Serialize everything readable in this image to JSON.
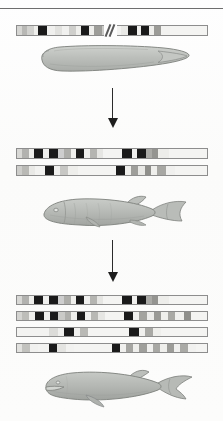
{
  "figure": {
    "background_color": "#fdfdfd",
    "rule_color": "#6e6e6e",
    "arrow_color": "#1d1d1d",
    "band_dark_color": "#1a1a1a",
    "band_light_color": "#f0f0ee",
    "organism_fill_color": "#b9bcb8",
    "organism_outline_color": "#7d807c"
  },
  "stages": [
    {
      "id": "stage-1",
      "label": "lancelet-stage",
      "organism_name": "lancelet",
      "chromosome_count": 1,
      "has_break_symbol": true,
      "break_symbol_name": "chromosome-break-slashes",
      "chromosomes": [
        {
          "id": "chromosome-1-1",
          "bands": [
            {
              "w": 5,
              "c": "#d6d6d3"
            },
            {
              "w": 5,
              "c": "#b8b8b5"
            },
            {
              "w": 6,
              "c": "#d2d2cf"
            },
            {
              "w": 4,
              "c": "#efefec"
            },
            {
              "w": 9,
              "c": "#1a1a1a"
            },
            {
              "w": 8,
              "c": "#f0f0ee"
            },
            {
              "w": 7,
              "c": "#e2e2df"
            },
            {
              "w": 6,
              "c": "#f1f1ef"
            },
            {
              "w": 7,
              "c": "#cfcfcc"
            },
            {
              "w": 5,
              "c": "#efefec"
            },
            {
              "w": 8,
              "c": "#1a1a1a"
            },
            {
              "w": 5,
              "c": "#eeeeeb"
            },
            {
              "w": 7,
              "c": "#9d9d99"
            },
            {
              "w": 6,
              "c": "#c9c9c6"
            },
            {
              "w": 13,
              "c": "#f3f3f1"
            },
            {
              "w": 7,
              "c": "#e9e9e6"
            },
            {
              "w": 8,
              "c": "#1a1a1a"
            },
            {
              "w": 4,
              "c": "#f0f0ee"
            },
            {
              "w": 8,
              "c": "#1a1a1a"
            },
            {
              "w": 5,
              "c": "#eeeeeb"
            },
            {
              "w": 7,
              "c": "#9b9b97"
            },
            {
              "w": 8,
              "c": "#f2f2f0"
            },
            {
              "w": 38,
              "c": "#f4f4f2"
            }
          ]
        }
      ]
    },
    {
      "id": "stage-2",
      "label": "fish-stage",
      "organism_name": "fish",
      "chromosome_count": 2,
      "has_break_symbol": false,
      "chromosomes": [
        {
          "id": "chromosome-2-1",
          "bands": [
            {
              "w": 5,
              "c": "#d8d8d5"
            },
            {
              "w": 6,
              "c": "#b2b2af"
            },
            {
              "w": 5,
              "c": "#eeeeeb"
            },
            {
              "w": 9,
              "c": "#1a1a1a"
            },
            {
              "w": 5,
              "c": "#f0f0ee"
            },
            {
              "w": 9,
              "c": "#1a1a1a"
            },
            {
              "w": 6,
              "c": "#cecece"
            },
            {
              "w": 6,
              "c": "#aeaeaa"
            },
            {
              "w": 5,
              "c": "#efefec"
            },
            {
              "w": 8,
              "c": "#1a1a1a"
            },
            {
              "w": 5,
              "c": "#f0f0ee"
            },
            {
              "w": 7,
              "c": "#b5b5b1"
            },
            {
              "w": 6,
              "c": "#e6e6e3"
            },
            {
              "w": 18,
              "c": "#f4f4f2"
            },
            {
              "w": 9,
              "c": "#1a1a1a"
            },
            {
              "w": 5,
              "c": "#f0f0ee"
            },
            {
              "w": 8,
              "c": "#1a1a1a"
            },
            {
              "w": 6,
              "c": "#aaaaa6"
            },
            {
              "w": 6,
              "c": "#949490"
            },
            {
              "w": 10,
              "c": "#ededea"
            },
            {
              "w": 38,
              "c": "#f4f4f2"
            }
          ]
        },
        {
          "id": "chromosome-2-2",
          "bands": [
            {
              "w": 5,
              "c": "#cdcdca"
            },
            {
              "w": 6,
              "c": "#b9b9b5"
            },
            {
              "w": 6,
              "c": "#e9e9e6"
            },
            {
              "w": 10,
              "c": "#f2f2f0"
            },
            {
              "w": 8,
              "c": "#1a1a1a"
            },
            {
              "w": 6,
              "c": "#f0f0ee"
            },
            {
              "w": 7,
              "c": "#c7c7c4"
            },
            {
              "w": 10,
              "c": "#eeeeeb"
            },
            {
              "w": 36,
              "c": "#f4f4f2"
            },
            {
              "w": 8,
              "c": "#1a1a1a"
            },
            {
              "w": 6,
              "c": "#efefec"
            },
            {
              "w": 7,
              "c": "#9e9e9a"
            },
            {
              "w": 6,
              "c": "#e8e8e5"
            },
            {
              "w": 6,
              "c": "#8f8f8b"
            },
            {
              "w": 6,
              "c": "#efefec"
            },
            {
              "w": 8,
              "c": "#a7a7a3"
            },
            {
              "w": 9,
              "c": "#f0f0ee"
            },
            {
              "w": 32,
              "c": "#f4f4f2"
            }
          ]
        }
      ]
    },
    {
      "id": "stage-3",
      "label": "whale-stage",
      "organism_name": "whale",
      "chromosome_count": 4,
      "has_break_symbol": false,
      "chromosomes": [
        {
          "id": "chromosome-3-1",
          "bands": [
            {
              "w": 5,
              "c": "#d8d8d5"
            },
            {
              "w": 6,
              "c": "#b2b2af"
            },
            {
              "w": 5,
              "c": "#eeeeeb"
            },
            {
              "w": 9,
              "c": "#1a1a1a"
            },
            {
              "w": 5,
              "c": "#f0f0ee"
            },
            {
              "w": 9,
              "c": "#1a1a1a"
            },
            {
              "w": 6,
              "c": "#cecece"
            },
            {
              "w": 6,
              "c": "#aeaeaa"
            },
            {
              "w": 5,
              "c": "#efefec"
            },
            {
              "w": 8,
              "c": "#1a1a1a"
            },
            {
              "w": 5,
              "c": "#f0f0ee"
            },
            {
              "w": 7,
              "c": "#b5b5b1"
            },
            {
              "w": 6,
              "c": "#e6e6e3"
            },
            {
              "w": 18,
              "c": "#f4f4f2"
            },
            {
              "w": 9,
              "c": "#1a1a1a"
            },
            {
              "w": 5,
              "c": "#f0f0ee"
            },
            {
              "w": 8,
              "c": "#1a1a1a"
            },
            {
              "w": 6,
              "c": "#aaaaa6"
            },
            {
              "w": 6,
              "c": "#949490"
            },
            {
              "w": 10,
              "c": "#ededea"
            },
            {
              "w": 38,
              "c": "#f4f4f2"
            }
          ]
        },
        {
          "id": "chromosome-3-2",
          "bands": [
            {
              "w": 5,
              "c": "#d4d4d1"
            },
            {
              "w": 6,
              "c": "#bdbdb9"
            },
            {
              "w": 6,
              "c": "#eeeeeb"
            },
            {
              "w": 8,
              "c": "#1a1a1a"
            },
            {
              "w": 5,
              "c": "#f0f0ee"
            },
            {
              "w": 8,
              "c": "#1a1a1a"
            },
            {
              "w": 6,
              "c": "#cacac7"
            },
            {
              "w": 6,
              "c": "#b0b0ac"
            },
            {
              "w": 5,
              "c": "#efefec"
            },
            {
              "w": 8,
              "c": "#1a1a1a"
            },
            {
              "w": 5,
              "c": "#f0f0ee"
            },
            {
              "w": 7,
              "c": "#b8b8b4"
            },
            {
              "w": 6,
              "c": "#e6e6e3"
            },
            {
              "w": 18,
              "c": "#f4f4f2"
            },
            {
              "w": 8,
              "c": "#1a1a1a"
            },
            {
              "w": 6,
              "c": "#f0f0ee"
            },
            {
              "w": 7,
              "c": "#a3a39f"
            },
            {
              "w": 6,
              "c": "#ececea"
            },
            {
              "w": 7,
              "c": "#9a9a96"
            },
            {
              "w": 6,
              "c": "#efefec"
            },
            {
              "w": 7,
              "c": "#a9a9a5"
            },
            {
              "w": 8,
              "c": "#f0f0ee"
            },
            {
              "w": 7,
              "c": "#8f8f8b"
            },
            {
              "w": 16,
              "c": "#f4f4f2"
            }
          ]
        },
        {
          "id": "chromosome-3-3",
          "bands": [
            {
              "w": 30,
              "c": "#f3f3f1"
            },
            {
              "w": 8,
              "c": "#dcdcd9"
            },
            {
              "w": 6,
              "c": "#f0f0ee"
            },
            {
              "w": 9,
              "c": "#1a1a1a"
            },
            {
              "w": 6,
              "c": "#f0f0ee"
            },
            {
              "w": 8,
              "c": "#b9b9b5"
            },
            {
              "w": 38,
              "c": "#f4f4f2"
            },
            {
              "w": 9,
              "c": "#1a1a1a"
            },
            {
              "w": 6,
              "c": "#f0f0ee"
            },
            {
              "w": 8,
              "c": "#a9a9a5"
            },
            {
              "w": 7,
              "c": "#efefec"
            },
            {
              "w": 45,
              "c": "#f4f4f2"
            }
          ]
        },
        {
          "id": "chromosome-3-4",
          "bands": [
            {
              "w": 5,
              "c": "#e2e2df"
            },
            {
              "w": 7,
              "c": "#c2c2be"
            },
            {
              "w": 8,
              "c": "#f1f1ef"
            },
            {
              "w": 10,
              "c": "#f3f3f1"
            },
            {
              "w": 8,
              "c": "#1a1a1a"
            },
            {
              "w": 8,
              "c": "#e4e4e1"
            },
            {
              "w": 8,
              "c": "#f2f2f0"
            },
            {
              "w": 36,
              "c": "#f4f4f2"
            },
            {
              "w": 8,
              "c": "#1a1a1a"
            },
            {
              "w": 5,
              "c": "#f0f0ee"
            },
            {
              "w": 7,
              "c": "#a5a5a1"
            },
            {
              "w": 6,
              "c": "#eeeeeb"
            },
            {
              "w": 7,
              "c": "#9f9f9b"
            },
            {
              "w": 6,
              "c": "#f0f0ee"
            },
            {
              "w": 7,
              "c": "#a8a8a4"
            },
            {
              "w": 6,
              "c": "#efefec"
            },
            {
              "w": 7,
              "c": "#9c9c98"
            },
            {
              "w": 6,
              "c": "#f0f0ee"
            },
            {
              "w": 7,
              "c": "#aaaaa6"
            },
            {
              "w": 8,
              "c": "#f1f1ef"
            },
            {
              "w": 12,
              "c": "#f4f4f2"
            }
          ]
        }
      ]
    }
  ],
  "arrows": [
    {
      "id": "arrow-1",
      "name": "evolution-arrow-lancelet-to-fish",
      "direction": "down"
    },
    {
      "id": "arrow-2",
      "name": "evolution-arrow-fish-to-whale",
      "direction": "down"
    }
  ]
}
